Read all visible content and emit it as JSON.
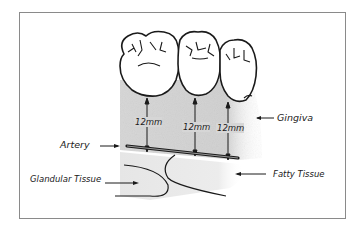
{
  "diagram": {
    "type": "anatomical-illustration",
    "labels": {
      "gingiva": "Gingiva",
      "artery": "Artery",
      "glandular_tissue": "Glandular Tissue",
      "fatty_tissue": "Fatty Tissue"
    },
    "measurements": [
      {
        "id": "m1",
        "value": "12mm"
      },
      {
        "id": "m2",
        "value": "12mm"
      },
      {
        "id": "m3",
        "value": "12mm"
      }
    ],
    "colors": {
      "ink": "#1a1a1a",
      "gingiva_shade": "#d8d8d8",
      "fatty_shade": "#ececec",
      "frame": "#8a8a8a",
      "background": "#ffffff"
    },
    "teeth_count": 3
  }
}
